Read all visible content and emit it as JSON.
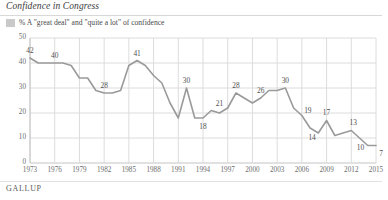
{
  "header": {
    "title": "Confidence in Congress"
  },
  "legend": {
    "swatch_color": "#c9c9c9",
    "label": "% A \"great deal\" and \"quite a lot\" of confidence"
  },
  "source": {
    "label": "GALLUP"
  },
  "style": {
    "line_color": "#9a9a9a",
    "grid_color": "#dcdcdc",
    "axis_color": "#c4c4c4",
    "label_color": "#4f4f4f",
    "tick_color": "#6d6d6d"
  },
  "chart_data": {
    "type": "line",
    "title": "Confidence in Congress",
    "subtitle": "% A \"great deal\" and \"quite a lot\" of confidence",
    "xlabel": "",
    "ylabel": "",
    "ylim": [
      0,
      50
    ],
    "yticks": [
      0,
      10,
      20,
      30,
      40,
      50
    ],
    "xlim": [
      1973,
      2015
    ],
    "xticks": [
      1973,
      1976,
      1979,
      1982,
      1985,
      1988,
      1991,
      1994,
      1997,
      2000,
      2003,
      2006,
      2009,
      2012,
      2015
    ],
    "grid": true,
    "legend_position": "top-left",
    "series": [
      {
        "name": "% A \"great deal\" and \"quite a lot\" of confidence",
        "color": "#9a9a9a",
        "x": [
          1973,
          1974,
          1975,
          1976,
          1977,
          1978,
          1979,
          1980,
          1981,
          1982,
          1983,
          1984,
          1985,
          1986,
          1987,
          1988,
          1989,
          1990,
          1991,
          1992,
          1993,
          1994,
          1995,
          1996,
          1997,
          1998,
          1999,
          2000,
          2001,
          2002,
          2003,
          2004,
          2005,
          2006,
          2007,
          2008,
          2009,
          2010,
          2011,
          2012,
          2013,
          2014,
          2015
        ],
        "y": [
          42,
          40,
          40,
          40,
          40,
          39,
          34,
          34,
          29,
          28,
          28,
          29,
          39,
          41,
          39,
          35,
          32,
          24,
          18,
          30,
          18,
          18,
          21,
          20,
          22,
          28,
          26,
          24,
          26,
          29,
          29,
          30,
          22,
          19,
          14,
          12,
          17,
          11,
          12,
          13,
          10,
          7,
          7
        ],
        "labels": [
          {
            "x": 1973,
            "y": 42,
            "text": "42"
          },
          {
            "x": 1976,
            "y": 40,
            "text": "40"
          },
          {
            "x": 1982,
            "y": 28,
            "text": "28"
          },
          {
            "x": 1986,
            "y": 41,
            "text": "41"
          },
          {
            "x": 1992,
            "y": 30,
            "text": "30"
          },
          {
            "x": 1994,
            "y": 18,
            "text": "18"
          },
          {
            "x": 1996,
            "y": 21,
            "text": "21"
          },
          {
            "x": 1998,
            "y": 28,
            "text": "28"
          },
          {
            "x": 2001,
            "y": 26,
            "text": "26"
          },
          {
            "x": 2004,
            "y": 30,
            "text": "30"
          },
          {
            "x": 2006,
            "y": 19,
            "text": "19"
          },
          {
            "x": 2007,
            "y": 14,
            "text": "14"
          },
          {
            "x": 2009,
            "y": 17,
            "text": "17"
          },
          {
            "x": 2012,
            "y": 13,
            "text": "13"
          },
          {
            "x": 2013,
            "y": 10,
            "text": "10"
          },
          {
            "x": 2015,
            "y": 7,
            "text": "7"
          }
        ]
      }
    ]
  }
}
